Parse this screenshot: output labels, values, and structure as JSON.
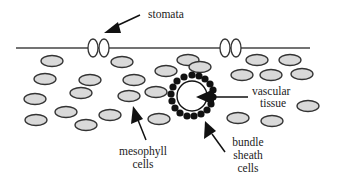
{
  "diagram": {
    "labels": {
      "stomata": "stomata",
      "vascular_line1": "vascular",
      "vascular_line2": "tissue",
      "mesophyll_line1": "mesophyll",
      "mesophyll_line2": "cells",
      "bundle_line1": "bundle",
      "bundle_line2": "sheath",
      "bundle_line3": "cells"
    },
    "colors": {
      "cell_fill": "#d9d9d9",
      "outline": "#333333",
      "bundle_sheath": "#111111",
      "background": "#ffffff"
    }
  }
}
